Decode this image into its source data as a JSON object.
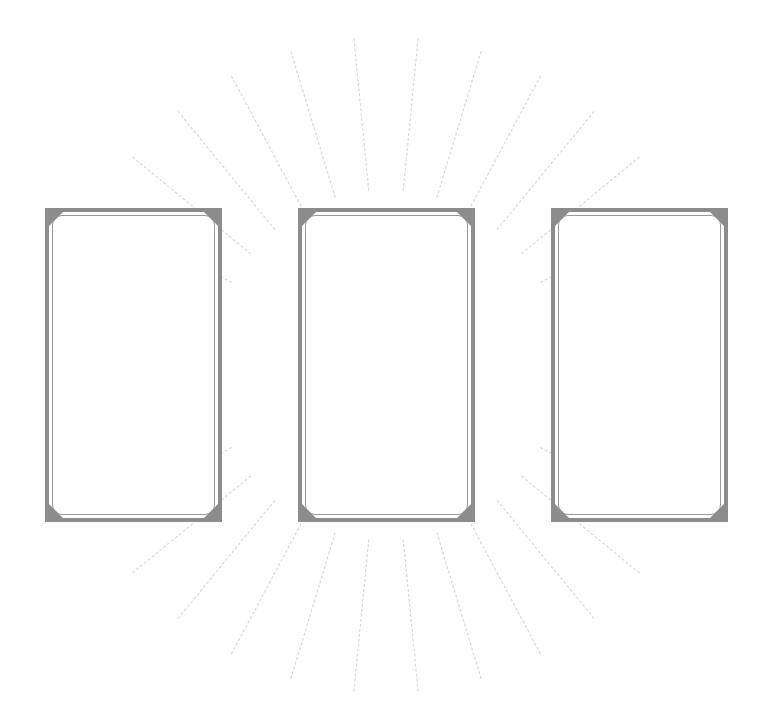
{
  "scene": {
    "description": "Three blank card frames arranged in a row over faint radiating sunburst lines",
    "background_color": "#ffffff",
    "frame_color": "#8c8c8c",
    "ray_color": "#d8d8d8",
    "ray_center": [
      386,
      365
    ]
  },
  "cards": [
    {
      "name": "card-left",
      "x": 45,
      "y": 208,
      "width": 177,
      "height": 314
    },
    {
      "name": "card-center",
      "x": 298,
      "y": 208,
      "width": 177,
      "height": 314
    },
    {
      "name": "card-right",
      "x": 551,
      "y": 208,
      "width": 177,
      "height": 314
    }
  ],
  "rays": {
    "count": 32,
    "inner_radius": 175,
    "outer_radius": 330
  }
}
